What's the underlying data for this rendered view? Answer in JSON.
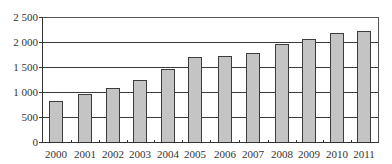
{
  "chart_data": {
    "type": "bar",
    "title": "",
    "xlabel": "",
    "ylabel": "",
    "categories": [
      "2000",
      "2001",
      "2002",
      "2003",
      "2004",
      "2005",
      "2006",
      "2007",
      "2008",
      "2009",
      "2010",
      "2011"
    ],
    "values": [
      820,
      970,
      1080,
      1240,
      1460,
      1700,
      1730,
      1790,
      1970,
      2070,
      2180,
      2230
    ],
    "ylim": [
      0,
      2500
    ],
    "yticks": [
      0,
      500,
      1000,
      1500,
      2000,
      2500
    ],
    "ytick_labels": [
      "0",
      "500",
      "1 000",
      "1 500",
      "2 000",
      "2 500"
    ],
    "grid": true,
    "legend": null,
    "colors": {
      "bar_fill": "#c4c4c4",
      "bar_border": "#3c3c3c",
      "grid": "#3a3a3a"
    }
  }
}
